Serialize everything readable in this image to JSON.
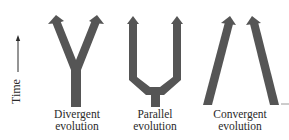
{
  "axis": {
    "label": "Time",
    "direction": "up"
  },
  "colors": {
    "arrow_fill": "#555555",
    "text": "#2a2a2a",
    "background": "#ffffff"
  },
  "patterns": [
    {
      "id": "divergent",
      "line1": "Divergent",
      "line2": "evolution"
    },
    {
      "id": "parallel",
      "line1": "Parallel",
      "line2": "evolution"
    },
    {
      "id": "convergent",
      "line1": "Convergent",
      "line2": "evolution"
    }
  ]
}
